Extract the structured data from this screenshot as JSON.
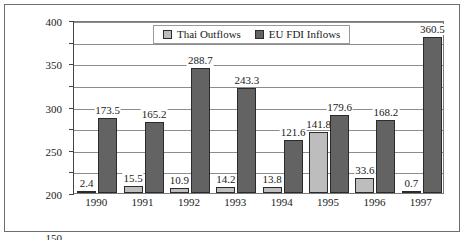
{
  "chart_data": {
    "type": "bar",
    "title": "",
    "xlabel": "",
    "ylabel": "",
    "ylim": [
      0,
      400
    ],
    "ytick_step": 50,
    "yticks": [
      "0",
      "50",
      "100",
      "150",
      "200",
      "250",
      "300",
      "350",
      "400"
    ],
    "grid": true,
    "legend_position": "top-center",
    "categories": [
      "1990",
      "1991",
      "1992",
      "1993",
      "1994",
      "1995",
      "1996",
      "1997"
    ],
    "series": [
      {
        "name": "Thai Outflows",
        "color": "#bdbdbd",
        "values": [
          2.4,
          15.5,
          10.9,
          14.2,
          13.8,
          141.8,
          33.6,
          0.7
        ],
        "labels": [
          "2.4",
          "15.5",
          "10.9",
          "14.2",
          "13.8",
          "141.8",
          "33.6",
          "0.7"
        ]
      },
      {
        "name": "EU FDI Inflows",
        "color": "#636363",
        "values": [
          173.5,
          165.2,
          288.7,
          243.3,
          121.6,
          179.6,
          168.2,
          360.5
        ],
        "labels": [
          "173.5",
          "165.2",
          "288.7",
          "243.3",
          "121.6",
          "179.6",
          "168.2",
          "360.5"
        ]
      }
    ]
  },
  "legend": {
    "entries": [
      {
        "label": "Thai Outflows",
        "swatch": "light"
      },
      {
        "label": "EU FDI Inflows",
        "swatch": "dark"
      }
    ]
  }
}
